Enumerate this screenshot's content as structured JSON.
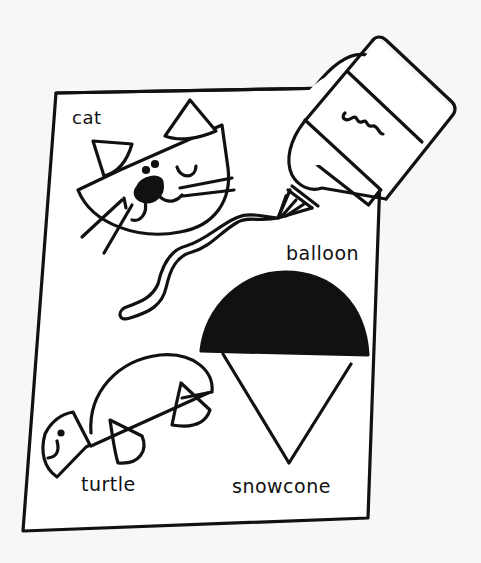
{
  "illustration": {
    "subject": "Hand-drawn craft sheet with glue bottle drawing yarn",
    "labels": {
      "cat": "cat",
      "balloon": "balloon",
      "turtle": "turtle",
      "snowcone": "snowcone"
    },
    "icons": {
      "glue_bottle": "glue-bottle-icon",
      "yarn_string": "yarn-icon",
      "cat_face": "cat-face-icon",
      "balloon_snowcone": "snowcone-icon",
      "turtle": "turtle-icon"
    },
    "colors": {
      "background": "#f7f7f5",
      "ink": "#111111",
      "paper": "#ffffff"
    }
  }
}
